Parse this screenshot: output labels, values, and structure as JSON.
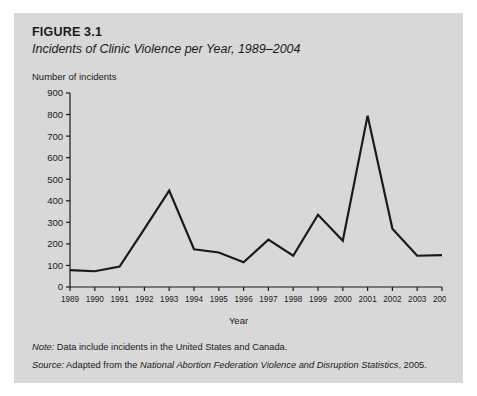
{
  "figure": {
    "number": "FIGURE 3.1",
    "caption": "Incidents of Clinic Violence per Year, 1989–2004"
  },
  "notes": {
    "note_label": "Note:",
    "note_text": " Data include incidents in the United States and Canada.",
    "source_label": "Source:",
    "source_prefix": " Adapted from the ",
    "source_italic": "National Abortion Federation Violence and Disruption Statistics",
    "source_suffix": ", 2005."
  },
  "colors": {
    "panel_background": "#d8d8d8",
    "page_background": "#ffffff",
    "line": "#1a1a1a",
    "axis": "#1a1a1a",
    "text": "#1a1a1a"
  },
  "chart_data": {
    "type": "line",
    "title": "Incidents of Clinic Violence per Year, 1989–2004",
    "xlabel": "Year",
    "ylabel": "Number of incidents",
    "grid": false,
    "legend": false,
    "ylim": [
      0,
      900
    ],
    "ytick_step": 100,
    "yticks": [
      0,
      100,
      200,
      300,
      400,
      500,
      600,
      700,
      800,
      900
    ],
    "ytick_labels": [
      "0",
      "100",
      "200",
      "300",
      "400",
      "500",
      "600",
      "700",
      "800",
      "900"
    ],
    "categories": [
      "1989",
      "1990",
      "1991",
      "1992",
      "1993",
      "1994",
      "1995",
      "1996",
      "1997",
      "1998",
      "1999",
      "2000",
      "2001",
      "2002",
      "2003",
      "2004"
    ],
    "x": [
      1989,
      1990,
      1991,
      1992,
      1993,
      1994,
      1995,
      1996,
      1997,
      1998,
      1999,
      2000,
      2001,
      2002,
      2003,
      2004
    ],
    "values": [
      78,
      73,
      95,
      270,
      447,
      175,
      160,
      115,
      220,
      145,
      335,
      215,
      795,
      270,
      145,
      148
    ]
  }
}
